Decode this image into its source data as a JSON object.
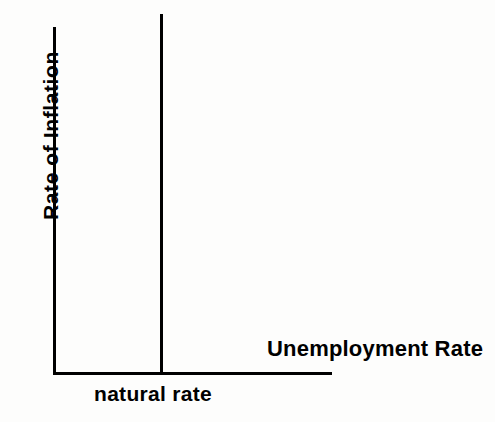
{
  "figure": {
    "type": "long-run-phillips-curve",
    "background_color": "#fdfdfc",
    "ink_color": "#000000"
  },
  "axes": {
    "y_label": "Rate of Inflation",
    "x_label": "Unemployment Rate"
  },
  "annotations": {
    "natural_rate": "natural rate"
  },
  "chart_data": {
    "type": "line",
    "title": "",
    "xlabel": "Unemployment Rate",
    "ylabel": "Rate of Inflation",
    "grid": false,
    "legend": false,
    "xlim": [
      0,
      10
    ],
    "ylim": [
      0,
      10
    ],
    "xticks": [],
    "yticks": [],
    "series": [
      {
        "name": "Long-run Phillips curve",
        "x": [
          3.85,
          3.85
        ],
        "y": [
          0,
          10.3
        ],
        "style": "solid",
        "color": "#000000",
        "width": 3
      }
    ],
    "annotations": [
      {
        "text": "natural rate",
        "x": 3.85,
        "y": -0.45,
        "anchor": "center",
        "describes": "x-position of the vertical long-run Phillips curve"
      }
    ]
  }
}
